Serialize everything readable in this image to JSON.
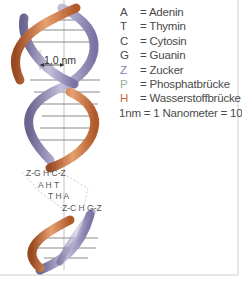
{
  "legend": {
    "items": [
      {
        "symbol": "A",
        "label": "= Adenin",
        "color": "#4a4a4a"
      },
      {
        "symbol": "T",
        "label": "= Thymin",
        "color": "#4a4a4a"
      },
      {
        "symbol": "C",
        "label": "=  Cytosin",
        "color": "#4a4a4a"
      },
      {
        "symbol": "G",
        "label": "= Guanin",
        "color": "#4a4a4a"
      },
      {
        "symbol": "Z",
        "label": "= Zucker",
        "color": "#7f7fb0"
      },
      {
        "symbol": "P",
        "label": "= Phosphatbrücke",
        "color": "#8fb38f"
      },
      {
        "symbol": "H",
        "label": "= Wasserstoffbrücke",
        "color": "#d06a3a"
      }
    ],
    "footer_prefix": "1nm = 1 Nanometer = 10",
    "footer_exp": "−9",
    "footer_unit": " m"
  },
  "diagram": {
    "scale_label": "1,0 nm",
    "strand_colors": {
      "strand_a": "#c8703a",
      "strand_b": "#8a84b0",
      "rungs": "#9a9a9a"
    },
    "base_pairs": [
      {
        "row": "Z-G H C-Z"
      },
      {
        "row": "A H T"
      },
      {
        "row": "T H A"
      },
      {
        "row": "Z-C H G-Z"
      }
    ]
  }
}
